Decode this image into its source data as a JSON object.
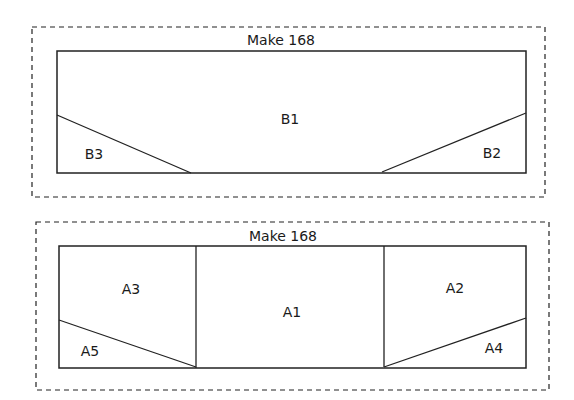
{
  "panels": [
    {
      "title": "Make 168",
      "pieces": [
        {
          "id": "B1",
          "label": "B1"
        },
        {
          "id": "B2",
          "label": "B2"
        },
        {
          "id": "B3",
          "label": "B3"
        }
      ]
    },
    {
      "title": "Make 168",
      "pieces": [
        {
          "id": "A1",
          "label": "A1"
        },
        {
          "id": "A2",
          "label": "A2"
        },
        {
          "id": "A3",
          "label": "A3"
        },
        {
          "id": "A4",
          "label": "A4"
        },
        {
          "id": "A5",
          "label": "A5"
        }
      ]
    }
  ],
  "colors": {
    "line": "#222222",
    "background": "#ffffff"
  }
}
